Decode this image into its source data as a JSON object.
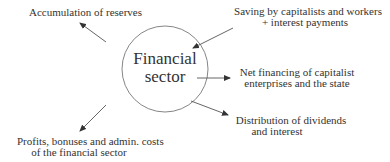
{
  "diagram": {
    "center_node": {
      "line1": "Financial",
      "line2": "sector"
    },
    "labels": {
      "top_left": {
        "line1": "Accumulation of reserves"
      },
      "top_right": {
        "line1": "Saving by capitalists and workers",
        "line2": "+ interest payments"
      },
      "right": {
        "line1": "Net financing of capitalist",
        "line2": "enterprises and the state"
      },
      "lower_right": {
        "line1": "Distribution of dividends",
        "line2": "and interest"
      },
      "lower_left": {
        "line1": "Profits, bonuses and admin. costs",
        "line2": "of the financial sector"
      }
    },
    "colors": {
      "stroke": "#555555",
      "text": "#333333",
      "background": "#ffffff"
    }
  }
}
